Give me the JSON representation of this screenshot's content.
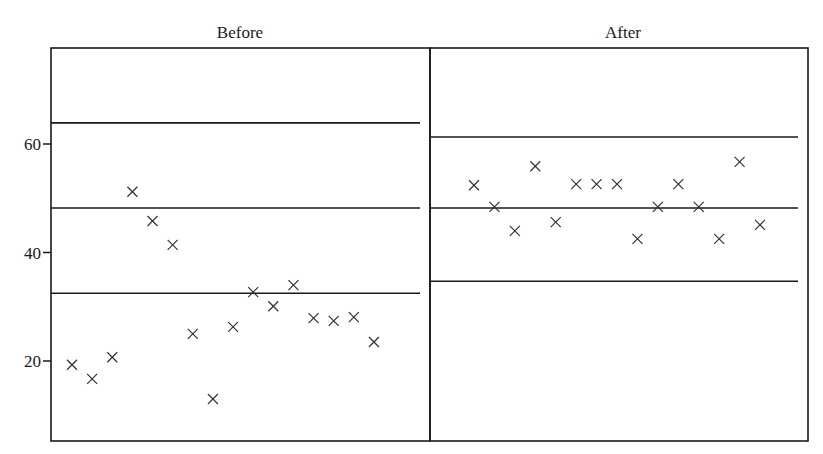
{
  "chart_data": {
    "type": "scatter",
    "title": "",
    "xlabel": "",
    "ylabel": "",
    "ylim": [
      6.3,
      67.7
    ],
    "yticks": [
      20,
      40,
      60
    ],
    "ytick_labels": [
      "20",
      "40",
      "60"
    ],
    "grid": false,
    "legend": null,
    "marker": "x",
    "panels": [
      {
        "name": "Before",
        "title": "Before",
        "reference_lines": {
          "upper": 63.9,
          "center": 48.2,
          "lower": 32.5
        },
        "x": [
          1,
          2,
          3,
          4,
          5,
          6,
          7,
          8,
          9,
          10,
          11,
          12,
          13,
          14,
          15,
          16
        ],
        "values": [
          19.3,
          16.7,
          20.7,
          51.2,
          45.8,
          41.4,
          25.0,
          13.0,
          26.3,
          32.7,
          30.1,
          34.0,
          27.9,
          27.4,
          28.1,
          23.5
        ]
      },
      {
        "name": "After",
        "title": "After",
        "reference_lines": {
          "upper": 61.3,
          "center": 48.2,
          "lower": 34.7
        },
        "x": [
          1,
          2,
          3,
          4,
          5,
          6,
          7,
          8,
          9,
          10,
          11,
          12,
          13,
          14,
          15
        ],
        "values": [
          52.4,
          48.4,
          44.0,
          55.9,
          45.6,
          52.6,
          52.6,
          52.6,
          42.5,
          48.4,
          52.6,
          48.4,
          42.5,
          56.7,
          45.1
        ]
      }
    ]
  },
  "layout": {
    "plot_top": 48,
    "plot_bottom": 441,
    "tick_ref_y": 144,
    "tick_ref_value": 60,
    "px_per_unit": 5.425,
    "panels": [
      {
        "left": 51,
        "right": 430,
        "title_x": 240,
        "line_x1": 51,
        "line_x2": 420,
        "first_x": 72,
        "step_x": 20.13
      },
      {
        "left": 430,
        "right": 808,
        "title_x": 623,
        "line_x1": 431,
        "line_x2": 798,
        "first_x": 474,
        "step_x": 20.43
      }
    ]
  }
}
